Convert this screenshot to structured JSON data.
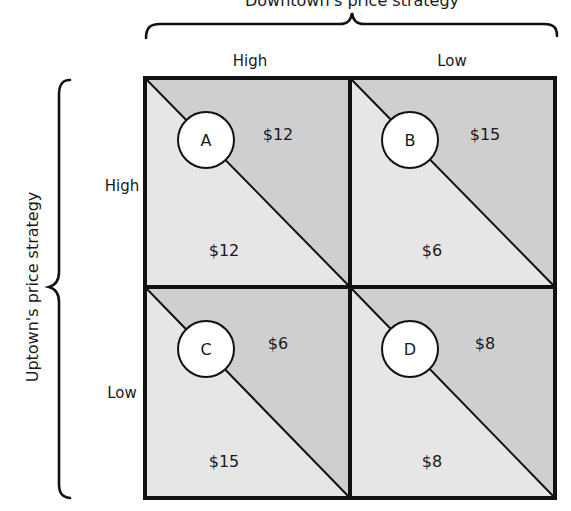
{
  "diagram": {
    "type": "payoff-matrix",
    "column_player_title": "Downtown's price strategy",
    "row_player_title": "Uptown's price strategy",
    "column_labels": [
      "High",
      "Low"
    ],
    "row_labels": [
      "High",
      "Low"
    ],
    "cells": [
      {
        "id": "A",
        "row": "High",
        "col": "High",
        "upper_right_payoff": "$12",
        "lower_left_payoff": "$12"
      },
      {
        "id": "B",
        "row": "High",
        "col": "Low",
        "upper_right_payoff": "$15",
        "lower_left_payoff": "$6"
      },
      {
        "id": "C",
        "row": "Low",
        "col": "High",
        "upper_right_payoff": "$6",
        "lower_left_payoff": "$15"
      },
      {
        "id": "D",
        "row": "Low",
        "col": "Low",
        "upper_right_payoff": "$8",
        "lower_left_payoff": "$8"
      }
    ],
    "colors": {
      "upper_triangle": "#cfcfcf",
      "lower_triangle": "#e6e6e6",
      "border": "#111111",
      "circle_fill": "#ffffff"
    }
  }
}
